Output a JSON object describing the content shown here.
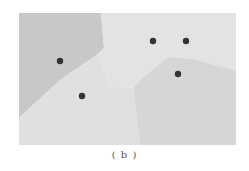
{
  "figure": {
    "caption": "( b )",
    "type": "voronoi-diagram",
    "frame": {
      "x": 19,
      "y": 13,
      "width": 217,
      "height": 132
    },
    "regions": [
      {
        "name": "region-top-left",
        "color": "#c8c8c8",
        "points": "19,13 101,13 104,48 98,54 60,80 19,118"
      },
      {
        "name": "region-top-right",
        "color": "#e3e3e3",
        "points": "101,13 236,13 236,70 218,66 195,59 168,57 140,80 133,88 110,85 98,54 104,48"
      },
      {
        "name": "region-bottom-left",
        "color": "#e0e0e0",
        "points": "19,118 60,80 98,54 110,85 133,88 140,145 19,145"
      },
      {
        "name": "region-bottom-right",
        "color": "#d6d6d6",
        "points": "133,88 140,80 168,57 195,59 218,66 236,70 236,145 140,145"
      }
    ],
    "sites": [
      {
        "x": 60,
        "y": 61
      },
      {
        "x": 82,
        "y": 96
      },
      {
        "x": 153,
        "y": 41
      },
      {
        "x": 186,
        "y": 41
      },
      {
        "x": 178,
        "y": 74
      }
    ],
    "site_color": "#333333"
  }
}
